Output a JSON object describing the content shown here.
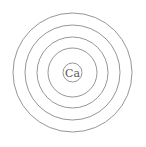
{
  "diagram": {
    "type": "bohr-model",
    "element_symbol": "Ca",
    "center": [
      72.5,
      72.5
    ],
    "nucleus_radius": 9.5,
    "shell_radii": [
      24.5,
      35.5,
      47.5,
      59.5
    ],
    "shell_count": 4,
    "stroke_color": "#8a8a8a",
    "label_color": "#555555",
    "background": "#ffffff"
  }
}
